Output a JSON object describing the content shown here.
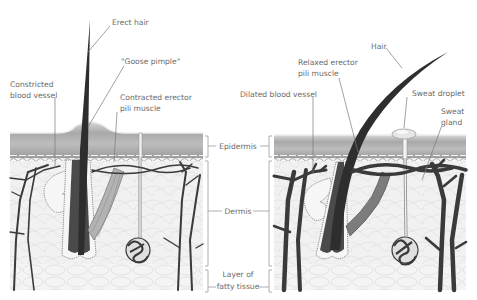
{
  "diagram": {
    "left_panel": {
      "state": "cold",
      "labels": {
        "erect_hair": "Erect hair",
        "goose_pimple": "\"Goose pimple\"",
        "constricted_vessel_1": "Constricted",
        "constricted_vessel_2": "blood vessel",
        "contracted_muscle_1": "Contracted erector",
        "contracted_muscle_2": "pili muscle"
      }
    },
    "right_panel": {
      "state": "warm",
      "labels": {
        "hair": "Hair",
        "relaxed_muscle_1": "Relaxed erector",
        "relaxed_muscle_2": "pili muscle",
        "dilated_vessel": "Dilated blood vessel",
        "sweat_droplet": "Sweat droplet",
        "sweat_gland_1": "Sweat",
        "sweat_gland_2": "gland"
      }
    },
    "layers": {
      "epidermis": "Epidermis",
      "dermis": "Dermis",
      "fatty_1": "Layer of",
      "fatty_2": "fatty tissue"
    },
    "colors": {
      "epidermis": "#a9a9a9",
      "dermis": "#ededed",
      "vessel": "#3a3a3a",
      "label": "#6a6a6a"
    }
  }
}
